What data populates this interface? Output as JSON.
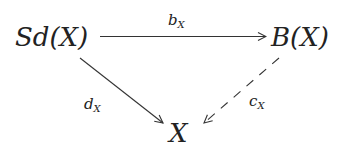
{
  "diagram": {
    "type": "commutative-triangle",
    "nodes": {
      "source": "Sd(X)",
      "target_right": "B(X)",
      "bottom": "X"
    },
    "arrows": {
      "top": {
        "base": "b",
        "sub": "X",
        "from": "Sd(X)",
        "to": "B(X)",
        "style": "solid"
      },
      "left": {
        "base": "d",
        "sub": "X",
        "from": "Sd(X)",
        "to": "X",
        "style": "solid"
      },
      "right": {
        "base": "c",
        "sub": "X",
        "from": "B(X)",
        "to": "X",
        "style": "dashed"
      }
    },
    "colors": {
      "stroke": "#333333",
      "text": "#222222",
      "background": "#ffffff"
    }
  }
}
